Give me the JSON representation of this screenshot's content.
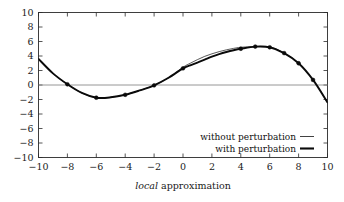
{
  "chart_data": {
    "type": "line",
    "title": "",
    "xlabel": "local approximation",
    "ylabel": "",
    "xlim": [
      -10,
      10
    ],
    "ylim": [
      -10,
      10
    ],
    "xticks": [
      -10,
      -8,
      -6,
      -4,
      -2,
      0,
      2,
      4,
      6,
      8,
      10
    ],
    "yticks": [
      -10,
      -8,
      -6,
      -4,
      -2,
      0,
      2,
      4,
      6,
      8,
      10
    ],
    "xtick_labels": [
      "-10",
      "-8",
      "-6",
      "-4",
      "-2",
      "0",
      "2",
      "4",
      "6",
      "8",
      "10"
    ],
    "ytick_labels": [
      "-10",
      "-8",
      "-6",
      "-4",
      "-2",
      "0",
      "2",
      "4",
      "6",
      "8",
      "10"
    ],
    "grid": false,
    "zero_line": true,
    "legend_position": "lower-right",
    "series": [
      {
        "name": "without perturbation",
        "style": "thin",
        "color": "#111111",
        "linewidth": 0.7,
        "markers": false,
        "x": [
          -10,
          -9,
          -8,
          -7,
          -6,
          -5,
          -4,
          -3,
          -2,
          -1,
          0,
          0.5,
          1,
          1.5,
          2,
          2.5,
          3,
          3.5,
          4,
          5,
          6,
          7,
          8,
          9,
          10
        ],
        "y": [
          3.6,
          1.6,
          0.1,
          -1.1,
          -1.75,
          -1.7,
          -1.35,
          -0.75,
          -0.05,
          1.0,
          2.45,
          3.0,
          3.5,
          3.95,
          4.3,
          4.6,
          4.85,
          5.05,
          5.2,
          5.3,
          5.25,
          4.4,
          3.0,
          0.7,
          -2.4
        ]
      },
      {
        "name": "with perturbation",
        "style": "thick",
        "color": "#0a0a0a",
        "linewidth": 1.9,
        "markers": true,
        "x": [
          -10,
          -9,
          -8,
          -7,
          -6,
          -5,
          -4,
          -3,
          -2,
          -1,
          0,
          0.5,
          1,
          1.5,
          2,
          2.5,
          3,
          3.5,
          4,
          5,
          6,
          7,
          8,
          9,
          10
        ],
        "y": [
          3.6,
          1.6,
          0.1,
          -1.1,
          -1.75,
          -1.7,
          -1.35,
          -0.75,
          -0.05,
          1.0,
          2.3,
          2.7,
          3.1,
          3.5,
          3.9,
          4.25,
          4.55,
          4.8,
          5.0,
          5.3,
          5.2,
          4.4,
          3.0,
          0.7,
          -2.4
        ],
        "marker_x": [
          -8,
          -6,
          -4,
          -2,
          0,
          4,
          5,
          6,
          7,
          8,
          9
        ],
        "marker_y": [
          0.1,
          -1.75,
          -1.35,
          -0.05,
          2.3,
          5.0,
          5.3,
          5.2,
          4.4,
          3.0,
          0.7
        ]
      }
    ]
  },
  "legend": {
    "entries": [
      {
        "label": "without perturbation",
        "italic_prefix": "",
        "style": "thin"
      },
      {
        "label": "perturbation",
        "italic_prefix": "with",
        "style": "thick"
      }
    ]
  },
  "colors": {
    "frame": "#2b2b2b",
    "zero_line": "#8a8a8a",
    "curve_thick": "#0a0a0a",
    "curve_thin": "#111111",
    "text": "#1a1a1a",
    "background": "#ffffff"
  },
  "xaxis_label": {
    "italic_part": "local",
    "roman_part": "approximation"
  }
}
